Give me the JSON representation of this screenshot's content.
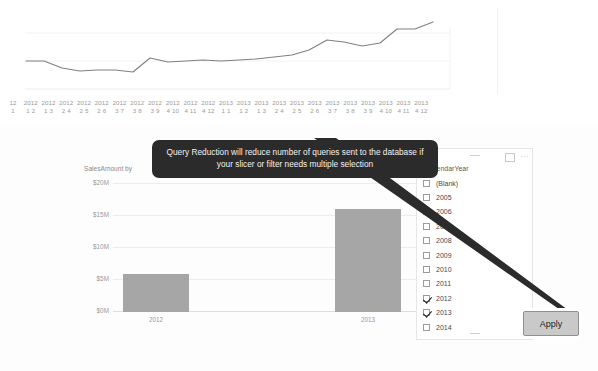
{
  "tooltip": {
    "text": "Query Reduction will reduce number of queries sent to the database if your slicer or filter needs multiple selection"
  },
  "apply_button": {
    "label": "Apply"
  },
  "slicer": {
    "title": "CalendarYear",
    "focus_icon": "focus-mode-icon",
    "more_icon": "···",
    "items": [
      {
        "label": "(Blank)",
        "checked": false
      },
      {
        "label": "2005",
        "checked": false
      },
      {
        "label": "2006",
        "checked": false
      },
      {
        "label": "2007",
        "checked": false
      },
      {
        "label": "2008",
        "checked": false
      },
      {
        "label": "2009",
        "checked": false
      },
      {
        "label": "2010",
        "checked": false
      },
      {
        "label": "2011",
        "checked": false
      },
      {
        "label": "2012",
        "checked": true
      },
      {
        "label": "2013",
        "checked": true
      },
      {
        "label": "2014",
        "checked": false
      }
    ]
  },
  "line_chart_axis": {
    "ticks": [
      {
        "top": "12",
        "bottom": "1"
      },
      {
        "top": "2012",
        "bottom": "1 2"
      },
      {
        "top": "2012",
        "bottom": "1 3"
      },
      {
        "top": "2012",
        "bottom": "2 4"
      },
      {
        "top": "2012",
        "bottom": "2 5"
      },
      {
        "top": "2012",
        "bottom": "2 6"
      },
      {
        "top": "2012",
        "bottom": "3 7"
      },
      {
        "top": "2012",
        "bottom": "3 8"
      },
      {
        "top": "2012",
        "bottom": "3 9"
      },
      {
        "top": "2012",
        "bottom": "4 10"
      },
      {
        "top": "2012",
        "bottom": "4 11"
      },
      {
        "top": "2012",
        "bottom": "4 12"
      },
      {
        "top": "2013",
        "bottom": "1 1"
      },
      {
        "top": "2013",
        "bottom": "1 2"
      },
      {
        "top": "2013",
        "bottom": "1 3"
      },
      {
        "top": "2013",
        "bottom": "2 4"
      },
      {
        "top": "2013",
        "bottom": "2 5"
      },
      {
        "top": "2013",
        "bottom": "2 6"
      },
      {
        "top": "2013",
        "bottom": "3 7"
      },
      {
        "top": "2013",
        "bottom": "3 8"
      },
      {
        "top": "2013",
        "bottom": "3 9"
      },
      {
        "top": "2013",
        "bottom": "4 10"
      },
      {
        "top": "2013",
        "bottom": "4 11"
      },
      {
        "top": "2013",
        "bottom": "4 12"
      }
    ]
  },
  "bar_chart": {
    "title": "SalesAmount by",
    "y_labels": [
      "$20M",
      "$15M",
      "$10M",
      "$5M",
      "$0M"
    ],
    "x_labels": [
      "2012",
      "2013"
    ]
  },
  "chart_data": [
    {
      "type": "line",
      "title": "",
      "xlabel": "",
      "ylabel": "",
      "grid": true,
      "legend": "none",
      "x": [
        "2012 1 1",
        "2012 1 2",
        "2012 1 3",
        "2012 2 4",
        "2012 2 5",
        "2012 2 6",
        "2012 3 7",
        "2012 3 8",
        "2012 3 9",
        "2012 4 10",
        "2012 4 11",
        "2012 4 12",
        "2013 1 1",
        "2013 1 2",
        "2013 1 3",
        "2013 2 4",
        "2013 2 5",
        "2013 2 6",
        "2013 3 7",
        "2013 3 8",
        "2013 3 9",
        "2013 4 10",
        "2013 4 11",
        "2013 4 12"
      ],
      "values": [
        0.5,
        0.5,
        0.4,
        0.34,
        0.37,
        0.37,
        0.33,
        0.6,
        0.5,
        0.5,
        0.54,
        0.53,
        0.55,
        0.57,
        0.6,
        0.63,
        0.72,
        0.9,
        0.88,
        0.8,
        0.84,
        1.05,
        1.05,
        1.15
      ],
      "ylim": [
        0,
        1.35
      ],
      "gridlines": [
        0.5,
        1.0
      ]
    },
    {
      "type": "bar",
      "title": "SalesAmount by",
      "categories": [
        "2012",
        "2013"
      ],
      "values": [
        5.8,
        16.0
      ],
      "xlabel": "",
      "ylabel": "",
      "ylim": [
        0,
        20
      ],
      "yticks": [
        0,
        5,
        10,
        15,
        20
      ],
      "ytick_labels": [
        "$0M",
        "$5M",
        "$10M",
        "$15M",
        "$20M"
      ],
      "unit": "M",
      "grid": true,
      "legend": "none",
      "bar_color": "#a6a6a6"
    }
  ]
}
